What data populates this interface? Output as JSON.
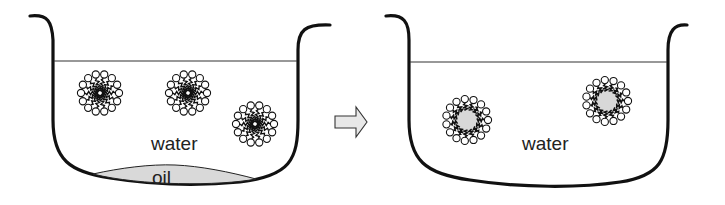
{
  "diagram": {
    "left_panel": {
      "liquid_label": "water",
      "bottom_layer_label": "oil",
      "micelles": [
        {
          "cx": 100,
          "cy": 93,
          "type": "normal"
        },
        {
          "cx": 188,
          "cy": 93,
          "type": "normal"
        },
        {
          "cx": 255,
          "cy": 124,
          "type": "normal"
        }
      ]
    },
    "arrow": {
      "direction": "right"
    },
    "right_panel": {
      "liquid_label": "water",
      "micelles": [
        {
          "cx": 467,
          "cy": 120,
          "type": "oil-filled"
        },
        {
          "cx": 607,
          "cy": 101,
          "type": "oil-filled"
        }
      ]
    },
    "colors": {
      "line": "#111111",
      "oil_fill": "#d8d8d8",
      "arrow_fill": "#e6e6e6"
    }
  }
}
